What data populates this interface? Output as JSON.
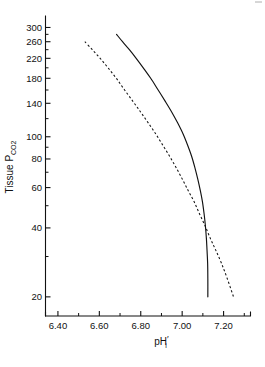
{
  "chart_data": {
    "type": "line",
    "title": "",
    "subtitle": "",
    "xlabel": "pH'i",
    "xlabel_base": "pH",
    "xlabel_subscript": "i",
    "xlabel_prime": "′",
    "ylabel": "Tissue PCO2",
    "ylabel_base": "Tissue P",
    "ylabel_subscript": "CO2",
    "yscale": "log",
    "xscale": "linear",
    "xlim": [
      6.34,
      7.33
    ],
    "ylim": [
      16.5,
      330
    ],
    "grid": false,
    "legend": "none",
    "axis_style": "open-frame-left-bottom",
    "x_ticks_major": [
      6.4,
      6.6,
      6.8,
      7.0,
      7.2
    ],
    "x_tick_labels": [
      "6.40",
      "6.60",
      "6.80",
      "7.00",
      "7.20"
    ],
    "x_ticks_minor": [
      6.5,
      6.7,
      6.9,
      7.1,
      7.3
    ],
    "y_ticks_major": [
      20,
      40,
      60,
      80,
      100,
      140,
      180,
      220,
      260,
      300
    ],
    "y_tick_labels": [
      "20",
      "40",
      "60",
      "80",
      "100",
      "140",
      "180",
      "220",
      "260",
      "300"
    ],
    "y_ticks_minor": [
      30,
      50,
      70,
      90,
      120,
      160,
      200,
      240,
      280
    ],
    "series": [
      {
        "name": "solid-curve",
        "style": "solid",
        "color": "#111111",
        "points": [
          [
            6.683,
            280
          ],
          [
            6.712,
            260
          ],
          [
            6.745,
            240
          ],
          [
            6.778,
            220
          ],
          [
            6.812,
            200
          ],
          [
            6.848,
            180
          ],
          [
            6.884,
            160
          ],
          [
            6.92,
            142
          ],
          [
            6.95,
            128
          ],
          [
            6.978,
            115
          ],
          [
            7.004,
            103
          ],
          [
            7.026,
            92
          ],
          [
            7.046,
            82
          ],
          [
            7.062,
            73
          ],
          [
            7.076,
            65
          ],
          [
            7.088,
            58
          ],
          [
            7.098,
            52
          ],
          [
            7.106,
            46
          ],
          [
            7.112,
            41
          ],
          [
            7.117,
            36
          ],
          [
            7.12,
            32
          ],
          [
            7.123,
            28
          ],
          [
            7.124,
            24
          ],
          [
            7.124,
            20
          ]
        ]
      },
      {
        "name": "dashed-curve",
        "style": "dashed",
        "color": "#111111",
        "points": [
          [
            6.53,
            260
          ],
          [
            6.566,
            240
          ],
          [
            6.604,
            220
          ],
          [
            6.642,
            200
          ],
          [
            6.682,
            180
          ],
          [
            6.722,
            160
          ],
          [
            6.764,
            142
          ],
          [
            6.8,
            128
          ],
          [
            6.836,
            115
          ],
          [
            6.872,
            103
          ],
          [
            6.906,
            92
          ],
          [
            6.94,
            82
          ],
          [
            6.972,
            73
          ],
          [
            7.002,
            65
          ],
          [
            7.03,
            58
          ],
          [
            7.058,
            52
          ],
          [
            7.084,
            46
          ],
          [
            7.11,
            41
          ],
          [
            7.136,
            36
          ],
          [
            7.162,
            32
          ],
          [
            7.19,
            28
          ],
          [
            7.218,
            24
          ],
          [
            7.248,
            20
          ]
        ]
      }
    ],
    "annotations": [
      {
        "name": "curve-intersection",
        "x": 7.06,
        "y": 45,
        "note": "solid and dashed curves cross"
      }
    ]
  }
}
